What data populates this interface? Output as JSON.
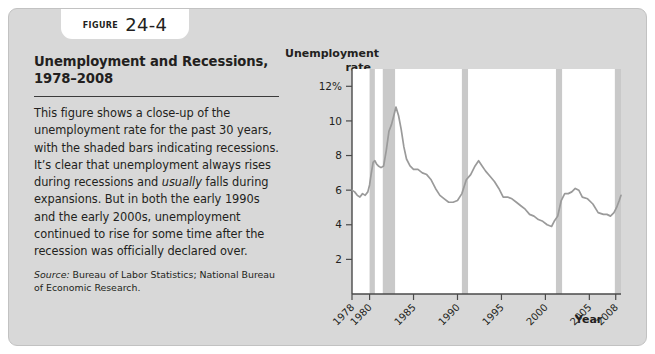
{
  "badge": {
    "figure_word": "Figure",
    "figure_number": "24-4"
  },
  "figure": {
    "title": "Unemployment and Recessions, 1978–2008",
    "body_part1": "This figure shows a close-up of the unemployment rate for the past 30 years, with the shaded bars indicating recessions. It’s clear that unemployment always rises during recessions and ",
    "body_emphasis": "usually",
    "body_part2": " falls during expansions. But in both the early 1990s and the early 2000s, unemployment continued to rise for some time after the recession was officially declared over.",
    "source_label": "Source:",
    "source_text": " Bureau of Labor Statistics; National Bureau of Economic Research."
  },
  "chart_data": {
    "type": "line",
    "title": "Unemployment and Recessions, 1978–2008",
    "xlabel": "Year",
    "ylabel": "Unemployment rate",
    "ylabel_line1": "Unemployment",
    "ylabel_line2": "rate",
    "xlim": [
      1978,
      2008.6
    ],
    "ylim": [
      0,
      13
    ],
    "grid": false,
    "legend": null,
    "ytick_values": [
      2,
      4,
      6,
      8,
      10,
      12
    ],
    "ytick_labels": [
      "2",
      "4",
      "6",
      "8",
      "10",
      "12%"
    ],
    "xtick_values": [
      1978,
      1980,
      1985,
      1990,
      1995,
      2000,
      2005,
      2008
    ],
    "xtick_labels": [
      "1978",
      "1980",
      "1985",
      "1990",
      "1995",
      "2000",
      "2005",
      "2008"
    ],
    "line_color": "#9a9a9a",
    "recession_color": "#c9c9c9",
    "plot_background": "#ffffff",
    "recessions": [
      {
        "label": "1980 recession",
        "start": 1980.0,
        "end": 1980.6
      },
      {
        "label": "1981–82 recession",
        "start": 1981.5,
        "end": 1982.9
      },
      {
        "label": "1990–91 recession",
        "start": 1990.5,
        "end": 1991.2
      },
      {
        "label": "2001 recession",
        "start": 2001.2,
        "end": 2001.9
      },
      {
        "label": "2007–08 recession",
        "start": 2007.9,
        "end": 2008.6
      }
    ],
    "series": [
      {
        "name": "Unemployment rate",
        "x": [
          1978.0,
          1978.3,
          1978.6,
          1978.9,
          1979.2,
          1979.5,
          1979.8,
          1980.0,
          1980.2,
          1980.4,
          1980.6,
          1980.8,
          1981.0,
          1981.3,
          1981.6,
          1981.9,
          1982.2,
          1982.5,
          1982.8,
          1983.0,
          1983.3,
          1983.6,
          1983.9,
          1984.2,
          1984.6,
          1985.0,
          1985.5,
          1986.0,
          1986.5,
          1987.0,
          1987.5,
          1988.0,
          1988.5,
          1989.0,
          1989.5,
          1990.0,
          1990.5,
          1991.0,
          1991.5,
          1992.0,
          1992.4,
          1992.8,
          1993.2,
          1993.7,
          1994.2,
          1994.7,
          1995.2,
          1995.7,
          1996.2,
          1996.7,
          1997.2,
          1997.7,
          1998.2,
          1998.7,
          1999.2,
          1999.7,
          2000.2,
          2000.7,
          2001.0,
          2001.4,
          2001.8,
          2002.2,
          2002.6,
          2003.0,
          2003.4,
          2003.8,
          2004.2,
          2004.8,
          2005.4,
          2006.0,
          2006.6,
          2007.0,
          2007.4,
          2007.8,
          2008.1,
          2008.4,
          2008.6
        ],
        "y": [
          6.0,
          5.9,
          5.7,
          5.6,
          5.8,
          5.7,
          5.9,
          6.3,
          7.0,
          7.6,
          7.7,
          7.5,
          7.4,
          7.3,
          7.4,
          8.3,
          9.4,
          9.8,
          10.4,
          10.8,
          10.3,
          9.5,
          8.5,
          7.8,
          7.4,
          7.2,
          7.2,
          7.0,
          6.9,
          6.6,
          6.1,
          5.7,
          5.5,
          5.3,
          5.3,
          5.4,
          5.8,
          6.6,
          6.9,
          7.4,
          7.7,
          7.4,
          7.1,
          6.8,
          6.5,
          6.1,
          5.6,
          5.6,
          5.5,
          5.3,
          5.1,
          4.9,
          4.6,
          4.5,
          4.3,
          4.2,
          4.0,
          3.9,
          4.2,
          4.5,
          5.4,
          5.8,
          5.8,
          5.9,
          6.1,
          6.0,
          5.6,
          5.5,
          5.2,
          4.7,
          4.6,
          4.6,
          4.5,
          4.7,
          5.0,
          5.4,
          5.7
        ]
      }
    ]
  }
}
